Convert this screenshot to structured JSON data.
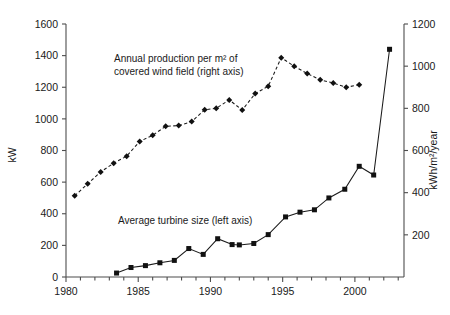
{
  "chart_data": {
    "type": "line",
    "title": "",
    "xlabel": "",
    "xlim": [
      1980,
      2003.4
    ],
    "x_ticks": [
      1980,
      1985,
      1990,
      1995,
      2000
    ],
    "x_tick_labels": [
      "1980",
      "1985",
      "1990",
      "1995",
      "2000"
    ],
    "x_minor_tick_step": 1,
    "grid": false,
    "legend": "inline-annotations",
    "axes": [
      {
        "id": "left",
        "label": "kW",
        "ylim": [
          0,
          1600
        ],
        "ticks": [
          0,
          200,
          400,
          600,
          800,
          1000,
          1200,
          1400,
          1600
        ],
        "tick_labels": [
          "0",
          "200",
          "400",
          "600",
          "800",
          "1000",
          "1200",
          "1400",
          "1600"
        ]
      },
      {
        "id": "right",
        "label": "kWh/m2/year",
        "label_display": "kWh/m²/year",
        "ylim": [
          0,
          1200
        ],
        "ticks": [
          0,
          200,
          400,
          600,
          800,
          1000,
          1200
        ],
        "tick_labels": [
          "0",
          "200",
          "400",
          "600",
          "800",
          "1000",
          "1200"
        ]
      }
    ],
    "series": [
      {
        "name": "Average turbine size (left axis)",
        "axis": "left",
        "marker": "square",
        "line_style": "solid",
        "annotation": "Average turbine size (left axis)",
        "x": [
          1983.5,
          1984.5,
          1985.5,
          1986.5,
          1987.5,
          1988.5,
          1989.5,
          1990.5,
          1991.5,
          1992.0,
          1993.0,
          1994.0,
          1995.2,
          1996.2,
          1997.2,
          1998.2,
          1999.3,
          2000.3,
          2001.3,
          2002.4
        ],
        "y": [
          25,
          60,
          72,
          90,
          105,
          180,
          143,
          242,
          205,
          203,
          212,
          268,
          380,
          410,
          425,
          500,
          555,
          700,
          645,
          1440
        ]
      },
      {
        "name": "Annual production per m2 of covered wind field (right axis)",
        "axis": "right",
        "marker": "diamond",
        "line_style": "dashed",
        "annotation_line1": "Annual production per m² of",
        "annotation_line2": "covered wind field (right axis)",
        "x": [
          1980.6,
          1981.5,
          1982.4,
          1983.3,
          1984.2,
          1985.1,
          1986.0,
          1986.9,
          1987.8,
          1988.7,
          1989.6,
          1990.4,
          1991.3,
          1992.2,
          1993.1,
          1994.0,
          1994.9,
          1995.8,
          1996.7,
          1997.6,
          1998.5,
          1999.4,
          2000.3
        ],
        "y": [
          385,
          442,
          498,
          540,
          573,
          643,
          672,
          715,
          718,
          737,
          793,
          800,
          840,
          792,
          870,
          905,
          1040,
          1000,
          965,
          935,
          920,
          900,
          912
        ]
      }
    ],
    "annotations": [
      {
        "name": "production-label",
        "text_line1": "Annual production per m² of",
        "text_line2": "covered wind field (right axis)"
      },
      {
        "name": "turbine-label",
        "text": "Average turbine size (left axis)"
      }
    ]
  }
}
